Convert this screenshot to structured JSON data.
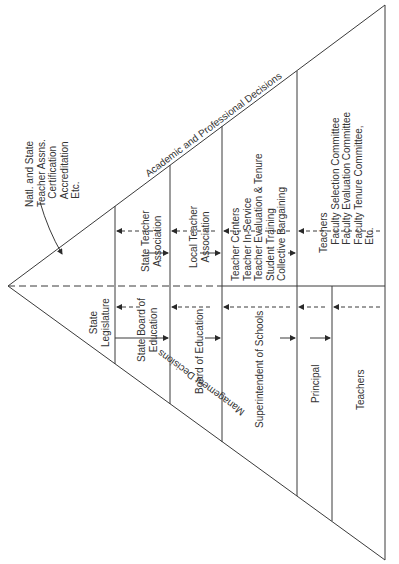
{
  "diagram": {
    "edges": {
      "upper_label": "Academic and Professional Decisions",
      "lower_label": "Management Decisions"
    },
    "external_note": "Natl. and State\nTeacher Assns.\n   Certification\n   Accreditation\n   Etc.",
    "academic_side": {
      "state_teacher_association": "State Teacher\nAssociation",
      "local_teacher_association": "Local Teacher\nAssociation",
      "teacher_centers": "Teacher Centers\nTeacher In-Service\nTeacher Evaluation & Tenure\nStudent Training\nCollective Bargaining",
      "teachers_committees": "Teachers\n   Faculty Selection Committee\n   Faculty Evaluation Committee\n   Faculty Tenure Committee,\n   Etc."
    },
    "management_side": {
      "state_legislature": "State\nLegislature",
      "state_board_of_education": "State Board of\nEducation",
      "board_of_education": "Board of Education",
      "superintendent": "Superintendent of Schools",
      "principal": "Principal",
      "teachers": "Teachers"
    },
    "colors": {
      "line": "#3a3a3a",
      "text": "#333333",
      "background": "#ffffff"
    }
  }
}
